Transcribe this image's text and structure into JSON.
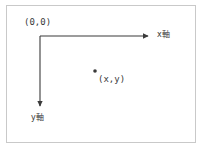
{
  "diagram": {
    "background_color": "#ffffff",
    "frame_border_color": "#c9c9c9",
    "line_color": "#3a3a3a",
    "text_color": "#3a3a3a",
    "labels": {
      "origin": "(0,0)",
      "x_axis": "x軸",
      "y_axis": "y軸",
      "point": "(x,y)"
    },
    "geometry": {
      "origin_x": 40,
      "origin_y": 36,
      "x_axis_end_x": 152,
      "x_axis_end_y": 36,
      "y_axis_end_x": 40,
      "y_axis_end_y": 110,
      "point_x": 95,
      "point_y": 71,
      "point_radius": 1.8
    }
  }
}
